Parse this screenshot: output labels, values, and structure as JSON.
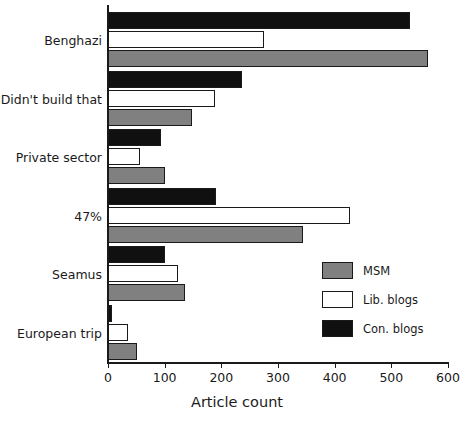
{
  "chart_data": {
    "type": "bar",
    "orientation": "horizontal",
    "title": "",
    "xlabel": "Article count",
    "ylabel": "",
    "xlim": [
      0,
      600
    ],
    "xticks": [
      0,
      100,
      200,
      300,
      400,
      500,
      600
    ],
    "xtick_labels": [
      "0",
      "100",
      "200",
      "300",
      "400",
      "500",
      "600"
    ],
    "grid": false,
    "legend_position": "center-right",
    "categories": [
      "Benghazi",
      "Didn't build that",
      "Private sector",
      "47%",
      "Seamus",
      "European trip"
    ],
    "series": [
      {
        "name": "MSM",
        "color": "#808080",
        "values": [
          564,
          148,
          100,
          344,
          136,
          51
        ]
      },
      {
        "name": "Lib. blogs",
        "color": "#ffffff",
        "values": [
          275,
          189,
          56,
          427,
          123,
          35
        ]
      },
      {
        "name": "Con. blogs",
        "color": "#101010",
        "values": [
          533,
          236,
          94,
          190,
          100,
          7
        ]
      }
    ],
    "series_draw_order_top_to_bottom": [
      "Con. blogs",
      "Lib. blogs",
      "MSM"
    ]
  },
  "legend": {
    "items": [
      {
        "label": "MSM",
        "swatch": "msm"
      },
      {
        "label": "Lib. blogs",
        "swatch": "lib"
      },
      {
        "label": "Con. blogs",
        "swatch": "con"
      }
    ]
  },
  "axis": {
    "x_title": "Article count"
  }
}
